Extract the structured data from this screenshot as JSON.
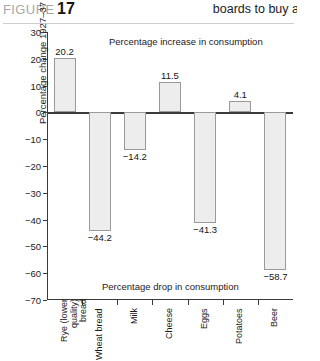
{
  "header": {
    "figure_label": "FIGURE",
    "figure_number": "17",
    "running_head": "boards to buy a"
  },
  "chart_data": {
    "type": "bar",
    "title": "",
    "xlabel": "",
    "ylabel": "Percentage change 1927–37",
    "ylim": [
      -70,
      30
    ],
    "ytick_step": 10,
    "grid": false,
    "legend": "none",
    "categories": [
      "Rye (lower quality) bread",
      "Wheat bread",
      "Milk",
      "Cheese",
      "Eggs",
      "Potatoes",
      "Beer"
    ],
    "values": [
      20.2,
      -44.2,
      -14.2,
      11.5,
      -41.3,
      4.1,
      -58.7
    ],
    "value_labels": [
      "20.2",
      "−44.2",
      "−14.2",
      "11.5",
      "−41.3",
      "4.1",
      "−58.7"
    ],
    "ytick_labels": [
      "30",
      "20",
      "10",
      "0",
      "−10",
      "−20",
      "−30",
      "−40",
      "−50",
      "−60",
      "−70"
    ],
    "ytick_values": [
      30,
      20,
      10,
      0,
      -10,
      -20,
      -30,
      -40,
      -50,
      -60,
      -70
    ],
    "annotations": [
      {
        "text": "Percentage increase in consumption",
        "position": "top"
      },
      {
        "text": "Percentage drop in consumption",
        "position": "bottom"
      }
    ],
    "bar_fill": "#ededed",
    "bar_stroke": "#9a9a9a"
  }
}
